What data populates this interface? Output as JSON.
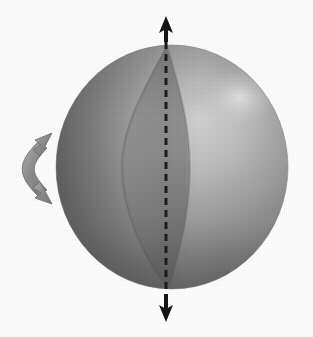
{
  "figure": {
    "title": "Rotating sphere with polar axis and shaded lune",
    "background_color": "#ffffff",
    "canvas": {
      "width": 313,
      "height": 337
    }
  },
  "sphere": {
    "label": "sphere",
    "center_x": 172,
    "center_y": 167,
    "radius_x": 116,
    "radius_y": 122,
    "base_color": "#8e8e8e",
    "light_color": "#c9c9c9",
    "dark_color": "#5f5f5f",
    "edge_color": "#6e6e6e",
    "highlight": {
      "x": 240,
      "y": 98,
      "radius": 34,
      "color": "#d6d6d6"
    }
  },
  "lune": {
    "label": "shaded-lune",
    "description": "Darker spherical wedge band left of the polar meridian",
    "color": "#6a6a6a",
    "opacity": 0.42,
    "left_bulge_x": 122,
    "right_edge_x": 167,
    "top_y": 46,
    "bottom_y": 289
  },
  "axis": {
    "label": "polar-axis",
    "style": "dashed",
    "color": "#1c1c1c",
    "x": 166,
    "top_y": 30,
    "bottom_y": 307,
    "dash_length": 7,
    "dash_gap": 5,
    "stroke_width": 3
  },
  "arrows": {
    "top": {
      "label": "axis-arrow-up",
      "direction": "up",
      "tip_x": 166,
      "tip_y": 18,
      "tail_y": 44,
      "color": "#141414"
    },
    "bottom": {
      "label": "axis-arrow-down",
      "direction": "down",
      "tip_x": 166,
      "tip_y": 320,
      "tail_y": 294,
      "color": "#141414"
    },
    "rotation": {
      "label": "rotation-arrow",
      "description": "Double-headed curved arrow indicating rotation about the axis",
      "color": "#8c8c8c",
      "outline_color": "#6d6d6d",
      "center_x": 52,
      "center_y": 165,
      "radius": 32,
      "start_angle_deg": -55,
      "end_angle_deg": 55,
      "head_count": 2
    }
  }
}
